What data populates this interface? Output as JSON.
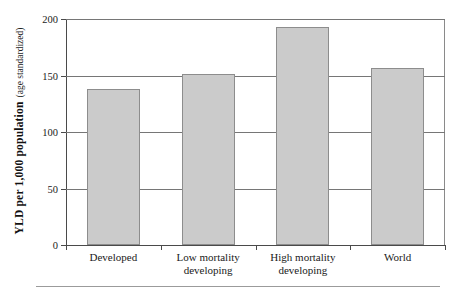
{
  "chart_data": {
    "type": "bar",
    "title": "",
    "categories": [
      "Developed",
      "Low mortality developing",
      "High mortality developing",
      "World"
    ],
    "category_lines": [
      [
        "Developed"
      ],
      [
        "Low mortality",
        "developing"
      ],
      [
        "High mortality",
        "developing"
      ],
      [
        "World"
      ]
    ],
    "values": [
      138,
      151,
      193,
      157
    ],
    "xlabel": "",
    "ylabel": "YLD per 1,000 population",
    "ylabel_sub": "(age standardized)",
    "ylim": [
      0,
      200
    ],
    "yticks": [
      0,
      50,
      100,
      150,
      200
    ],
    "ytick_labels": [
      "0",
      "50",
      "100",
      "150",
      "200"
    ],
    "grid": "horizontal",
    "legend": "none",
    "bar_fill": "#cbcbcb",
    "bar_border": "#8d8d8d",
    "axis_color": "#4a4a4a",
    "grid_color": "#767676"
  }
}
